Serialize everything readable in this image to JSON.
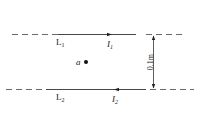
{
  "diagram": {
    "wires": [
      {
        "label": "L",
        "sub": "1",
        "current": "I",
        "current_sub": "1",
        "direction": "right"
      },
      {
        "label": "L",
        "sub": "2",
        "current": "I",
        "current_sub": "2",
        "direction": "left"
      }
    ],
    "point": {
      "label": "a"
    },
    "separation": "0.1m"
  }
}
